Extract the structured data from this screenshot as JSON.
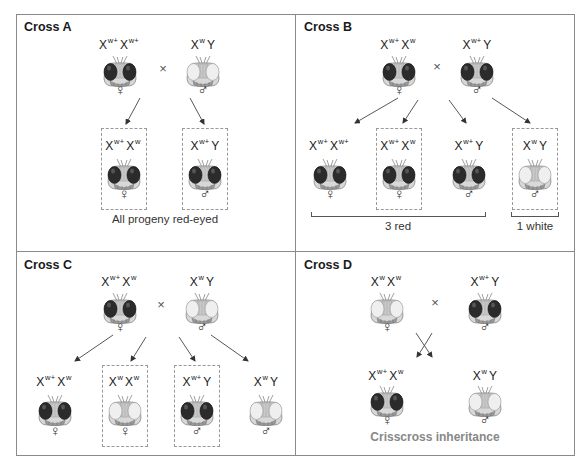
{
  "panels": {
    "A": {
      "title": "Cross A",
      "parents": [
        {
          "genotype_base": [
            "X",
            "X"
          ],
          "genotype_sup": [
            "w+",
            "w+"
          ],
          "eye": "red",
          "sex": "♀"
        },
        {
          "genotype_base": [
            "X",
            "Y"
          ],
          "genotype_sup": [
            "w",
            ""
          ],
          "eye": "white",
          "sex": "♂"
        }
      ],
      "cross_symbol": "×",
      "progeny": [
        {
          "genotype_base": [
            "X",
            "X"
          ],
          "genotype_sup": [
            "w+",
            "w"
          ],
          "eye": "red",
          "sex": "♀",
          "boxed": true
        },
        {
          "genotype_base": [
            "X",
            "Y"
          ],
          "genotype_sup": [
            "w+",
            ""
          ],
          "eye": "red",
          "sex": "♂",
          "boxed": true
        }
      ],
      "caption": "All progeny red-eyed"
    },
    "B": {
      "title": "Cross B",
      "parents": [
        {
          "genotype_base": [
            "X",
            "X"
          ],
          "genotype_sup": [
            "w+",
            "w"
          ],
          "eye": "red",
          "sex": "♀"
        },
        {
          "genotype_base": [
            "X",
            "Y"
          ],
          "genotype_sup": [
            "w+",
            ""
          ],
          "eye": "red",
          "sex": "♂"
        }
      ],
      "cross_symbol": "×",
      "progeny": [
        {
          "genotype_base": [
            "X",
            "X"
          ],
          "genotype_sup": [
            "w+",
            "w+"
          ],
          "eye": "red",
          "sex": "♀",
          "boxed": false
        },
        {
          "genotype_base": [
            "X",
            "X"
          ],
          "genotype_sup": [
            "w+",
            "w"
          ],
          "eye": "red",
          "sex": "♀",
          "boxed": true
        },
        {
          "genotype_base": [
            "X",
            "Y"
          ],
          "genotype_sup": [
            "w+",
            ""
          ],
          "eye": "red",
          "sex": "♂",
          "boxed": false
        },
        {
          "genotype_base": [
            "X",
            "Y"
          ],
          "genotype_sup": [
            "w",
            ""
          ],
          "eye": "white",
          "sex": "♂",
          "boxed": true
        }
      ],
      "ratio_labels": [
        "3 red",
        "1 white"
      ]
    },
    "C": {
      "title": "Cross C",
      "parents": [
        {
          "genotype_base": [
            "X",
            "X"
          ],
          "genotype_sup": [
            "w+",
            "w"
          ],
          "eye": "red",
          "sex": "♀"
        },
        {
          "genotype_base": [
            "X",
            "Y"
          ],
          "genotype_sup": [
            "w",
            ""
          ],
          "eye": "white",
          "sex": "♂"
        }
      ],
      "cross_symbol": "×",
      "progeny": [
        {
          "genotype_base": [
            "X",
            "X"
          ],
          "genotype_sup": [
            "w+",
            "w"
          ],
          "eye": "red",
          "sex": "♀",
          "boxed": false
        },
        {
          "genotype_base": [
            "X",
            "X"
          ],
          "genotype_sup": [
            "w",
            "w"
          ],
          "eye": "white",
          "sex": "♀",
          "boxed": true
        },
        {
          "genotype_base": [
            "X",
            "Y"
          ],
          "genotype_sup": [
            "w+",
            ""
          ],
          "eye": "red",
          "sex": "♂",
          "boxed": true
        },
        {
          "genotype_base": [
            "X",
            "Y"
          ],
          "genotype_sup": [
            "w",
            ""
          ],
          "eye": "white",
          "sex": "♂",
          "boxed": false
        }
      ]
    },
    "D": {
      "title": "Cross D",
      "parents": [
        {
          "genotype_base": [
            "X",
            "X"
          ],
          "genotype_sup": [
            "w",
            "w"
          ],
          "eye": "white",
          "sex": "♀"
        },
        {
          "genotype_base": [
            "X",
            "Y"
          ],
          "genotype_sup": [
            "w+",
            ""
          ],
          "eye": "red",
          "sex": "♂"
        }
      ],
      "cross_symbol": "×",
      "progeny": [
        {
          "genotype_base": [
            "X",
            "X"
          ],
          "genotype_sup": [
            "w+",
            "w"
          ],
          "eye": "red",
          "sex": "♀",
          "boxed": false
        },
        {
          "genotype_base": [
            "X",
            "Y"
          ],
          "genotype_sup": [
            "w",
            ""
          ],
          "eye": "white",
          "sex": "♂",
          "boxed": false
        }
      ],
      "caption": "Crisscross inheritance"
    }
  },
  "colors": {
    "red_eye": "#2a2a2a",
    "white_eye": "#e6e6e6",
    "border": "#8a8a8a",
    "dashed_box": "#999999",
    "caption_gray": "#888888"
  }
}
